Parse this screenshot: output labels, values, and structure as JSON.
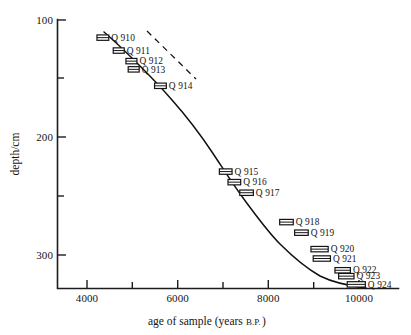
{
  "chart_data": {
    "type": "scatter",
    "title": "",
    "xlabel": "age of sample (years B.P.)",
    "xlabel_main": "age of sample (years ",
    "xlabel_smallcaps": "B.P.",
    "xlabel_tail": ")",
    "ylabel": "depth/cm",
    "xlim": [
      2900,
      10900
    ],
    "ylim": [
      100,
      330
    ],
    "y_axis_inverted": true,
    "grid": false,
    "legend": "none",
    "x_ticks_major": [
      4000,
      6000,
      8000,
      10000
    ],
    "x_tick_labels": [
      "4000",
      "6000",
      "8000",
      "10000"
    ],
    "x_ticks_minor": [
      5000,
      7000,
      9000
    ],
    "y_ticks_major": [
      100,
      200,
      300
    ],
    "y_tick_labels": [
      "100",
      "200",
      "300"
    ],
    "y_ticks_minor": [
      150,
      250
    ],
    "series": [
      {
        "name": "radiocarbon samples",
        "marker": "horizontal-error-box",
        "points": [
          {
            "label": "Q 910",
            "x": 4350,
            "y": 115,
            "xerr": 130,
            "label_pos": "right"
          },
          {
            "label": "Q 911",
            "x": 4700,
            "y": 126,
            "xerr": 115,
            "label_pos": "right"
          },
          {
            "label": "Q 912",
            "x": 4980,
            "y": 135,
            "xerr": 120,
            "label_pos": "right"
          },
          {
            "label": "Q 913",
            "x": 5030,
            "y": 142,
            "xerr": 120,
            "label_pos": "right"
          },
          {
            "label": "Q 914",
            "x": 5620,
            "y": 156,
            "xerr": 130,
            "label_pos": "right"
          },
          {
            "label": "Q 915",
            "x": 7060,
            "y": 229,
            "xerr": 140,
            "label_pos": "right"
          },
          {
            "label": "Q 916",
            "x": 7250,
            "y": 238,
            "xerr": 140,
            "label_pos": "right"
          },
          {
            "label": "Q 917",
            "x": 7520,
            "y": 247,
            "xerr": 150,
            "label_pos": "right"
          },
          {
            "label": "Q 918",
            "x": 8400,
            "y": 272,
            "xerr": 150,
            "label_pos": "right"
          },
          {
            "label": "Q 919",
            "x": 8730,
            "y": 281,
            "xerr": 150,
            "label_pos": "right"
          },
          {
            "label": "Q 920",
            "x": 9130,
            "y": 295,
            "xerr": 190,
            "label_pos": "right"
          },
          {
            "label": "Q 921",
            "x": 9180,
            "y": 303,
            "xerr": 190,
            "label_pos": "right"
          },
          {
            "label": "Q 922",
            "x": 9640,
            "y": 313,
            "xerr": 170,
            "label_pos": "right"
          },
          {
            "label": "Q 923",
            "x": 9720,
            "y": 318,
            "xerr": 170,
            "label_pos": "right"
          },
          {
            "label": "Q 924",
            "x": 9940,
            "y": 325,
            "xerr": 200,
            "label_pos": "right"
          }
        ]
      }
    ],
    "annotations": [
      {
        "name": "sedimentation-curve",
        "kind": "solid-curve",
        "description": "best-fit age-depth curve through samples"
      },
      {
        "name": "reference-dashed-line",
        "kind": "dashed-line",
        "description": "straight dashed reference line upper right"
      }
    ]
  }
}
